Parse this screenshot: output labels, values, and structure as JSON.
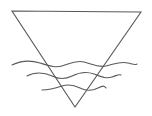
{
  "diagram": {
    "title": "",
    "background": "#ffffff",
    "stroke_color": "#5a5a5a",
    "stroke_width": 1.1,
    "shapes": {
      "triangle": {
        "kind": "inverted-triangle",
        "points": [
          [
            12,
            11
          ],
          [
            141,
            12
          ],
          [
            75,
            107
          ]
        ]
      },
      "waves": [
        {
          "name": "wave-top",
          "path": "M12,65 C20,61 30,60 40,63 S55,68 62,66 S75,60 84,62 S97,68 106,66 S120,61 128,63 S135,65 137,64"
        },
        {
          "name": "wave-middle",
          "path": "M27,76 C34,72 44,72 52,76 S66,79 72,76 S86,71 94,74 S106,79 112,77 S119,74 121,75"
        },
        {
          "name": "wave-bottom",
          "path": "M42,90 C50,90 56,88 62,86 S74,85 80,88 S92,91 98,88 S104,86 106,88"
        }
      ]
    },
    "labels": []
  }
}
